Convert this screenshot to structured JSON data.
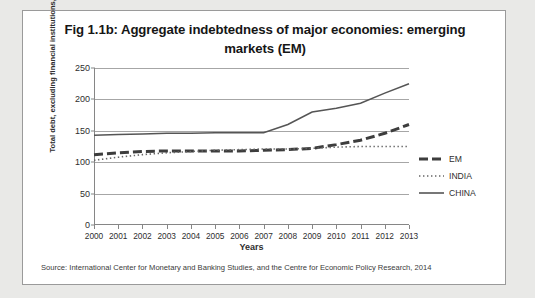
{
  "figure": {
    "title": "Fig 1.1b: Aggregate indebtedness of major economies: emerging markets (EM)",
    "source_note": "Source:  International Center for Monetary and Banking Studies, and the Centre for Economic Policy Research, 2014"
  },
  "chart_data": {
    "type": "line",
    "title": "Fig 1.1b: Aggregate indebtedness of major economies: emerging markets (EM)",
    "xlabel": "Years",
    "ylabel": "Total debt, excluding financial institutions, as % of GDP",
    "ylim": [
      0,
      250
    ],
    "ytick_labels": [
      "0",
      "50",
      "100",
      "150",
      "200",
      "250"
    ],
    "yticks": [
      0,
      50,
      100,
      150,
      200,
      250
    ],
    "grid": true,
    "legend_position": "right",
    "categories": [
      "2000",
      "2001",
      "2002",
      "2003",
      "2004",
      "2005",
      "2006",
      "2007",
      "2008",
      "2009",
      "2010",
      "2011",
      "2012",
      "2013"
    ],
    "series": [
      {
        "name": "EM",
        "style": "dashed-thick",
        "values": [
          112,
          115,
          117,
          118,
          118,
          118,
          118,
          119,
          120,
          122,
          128,
          135,
          146,
          160
        ]
      },
      {
        "name": "INDIA",
        "style": "dotted",
        "values": [
          103,
          108,
          112,
          115,
          117,
          119,
          120,
          121,
          121,
          122,
          124,
          125,
          125,
          125
        ]
      },
      {
        "name": "CHINA",
        "style": "solid",
        "values": [
          143,
          144,
          145,
          146,
          146,
          147,
          147,
          147,
          160,
          180,
          186,
          194,
          210,
          225
        ]
      }
    ]
  },
  "legend": {
    "items": [
      {
        "label": "EM"
      },
      {
        "label": "INDIA"
      },
      {
        "label": "CHINA"
      }
    ]
  }
}
